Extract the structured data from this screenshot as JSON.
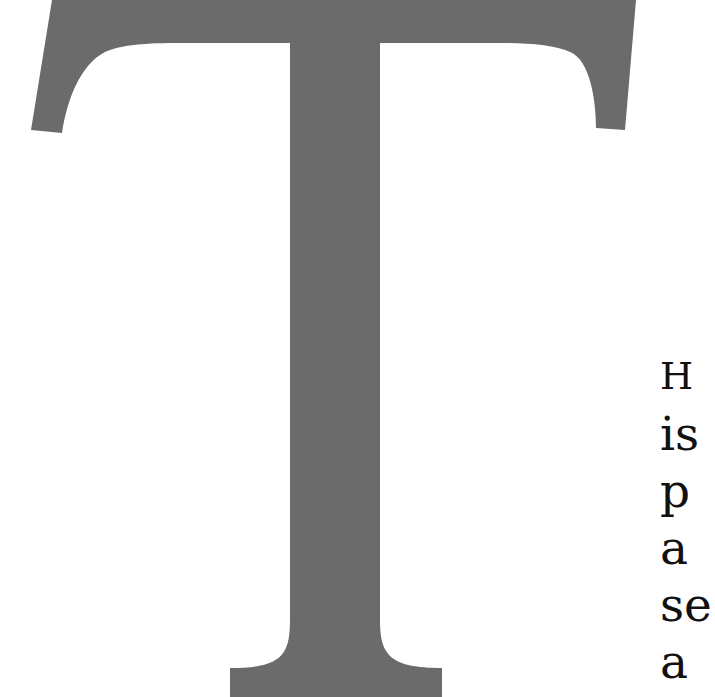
{
  "page": {
    "background": "#ffffff"
  },
  "drop_cap": {
    "letter": "T",
    "color": "#6b6b6b"
  },
  "body_text": {
    "color": "#111111",
    "lines": [
      "H",
      "is",
      "p",
      "a",
      "se",
      "a"
    ]
  }
}
